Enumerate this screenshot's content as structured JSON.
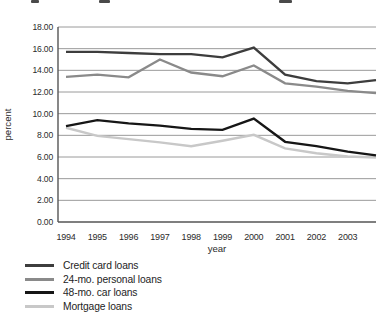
{
  "chart_data": {
    "type": "line",
    "title": "",
    "xlabel": "year",
    "ylabel": "percent",
    "x": [
      1994,
      1995,
      1996,
      1997,
      1998,
      1999,
      2000,
      2001,
      2002,
      2003
    ],
    "ylim": [
      0,
      18
    ],
    "ytick_step": 2,
    "yticks": [
      "18.00",
      "16.00",
      "14.00",
      "12.00",
      "10.00",
      "8.00",
      "6.00",
      "4.00",
      "2.00",
      "0.00"
    ],
    "grid": "horizontal-only",
    "legend_position": "below-left",
    "plot_note": "lines continue past the 2003 tick to the right edge of the plot area; edge_value is the value where each line meets the right edge",
    "series": [
      {
        "name": "Credit card loans",
        "color": "#3d3d3d",
        "values": [
          15.7,
          15.7,
          15.6,
          15.5,
          15.5,
          15.2,
          16.1,
          13.6,
          13.0,
          12.8
        ],
        "edge_value": 13.1
      },
      {
        "name": "24-mo. personal loans",
        "color": "#8a8a8a",
        "values": [
          13.4,
          13.6,
          13.35,
          15.0,
          13.8,
          13.45,
          14.45,
          12.8,
          12.5,
          12.1
        ],
        "edge_value": 11.9
      },
      {
        "name": "48-mo. car loans",
        "color": "#161616",
        "values": [
          8.85,
          9.4,
          9.1,
          8.9,
          8.6,
          8.5,
          9.55,
          7.4,
          7.0,
          6.5
        ],
        "edge_value": 6.15
      },
      {
        "name": "Mortgage loans",
        "color": "#c8c8c8",
        "values": [
          8.7,
          7.95,
          7.65,
          7.35,
          7.0,
          7.5,
          8.05,
          6.8,
          6.35,
          6.05
        ],
        "edge_value": 5.95
      }
    ]
  }
}
